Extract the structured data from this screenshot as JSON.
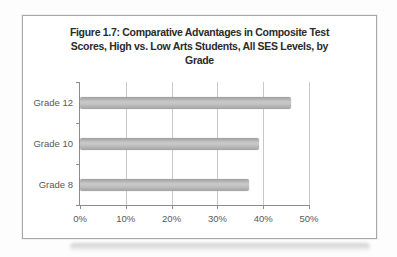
{
  "figure": {
    "title_lines": [
      "Figure 1.7:  Comparative Advantages in Composite Test",
      "Scores, High vs. Low Arts Students, All SES Levels, by",
      "Grade"
    ]
  },
  "chart_data": {
    "type": "bar",
    "orientation": "horizontal",
    "title": "Figure 1.7: Comparative Advantages in Composite Test Scores, High vs. Low Arts Students, All SES Levels, by Grade",
    "categories": [
      "Grade 12",
      "Grade 10",
      "Grade 8"
    ],
    "values": [
      46,
      39,
      37
    ],
    "value_unit": "percent",
    "xlabel": "",
    "ylabel": "",
    "xlim": [
      0,
      50
    ],
    "x_ticks": [
      "0%",
      "10%",
      "20%",
      "30%",
      "40%",
      "50%"
    ],
    "x_tick_values": [
      0,
      10,
      20,
      30,
      40,
      50
    ],
    "grid": "vertical gridlines at each 10% tick",
    "legend": "none",
    "bar_color": "#bdbdbd"
  },
  "colors": {
    "title_text": "#2b2b2b",
    "axis_text": "#595959",
    "gridline": "#c9c9c9",
    "axis_line": "#8c8c8c",
    "bar_fill_gradient_mid": "#c9c9c9",
    "frame_border": "#a8a8a8",
    "page_background": "#fdfdfd"
  }
}
